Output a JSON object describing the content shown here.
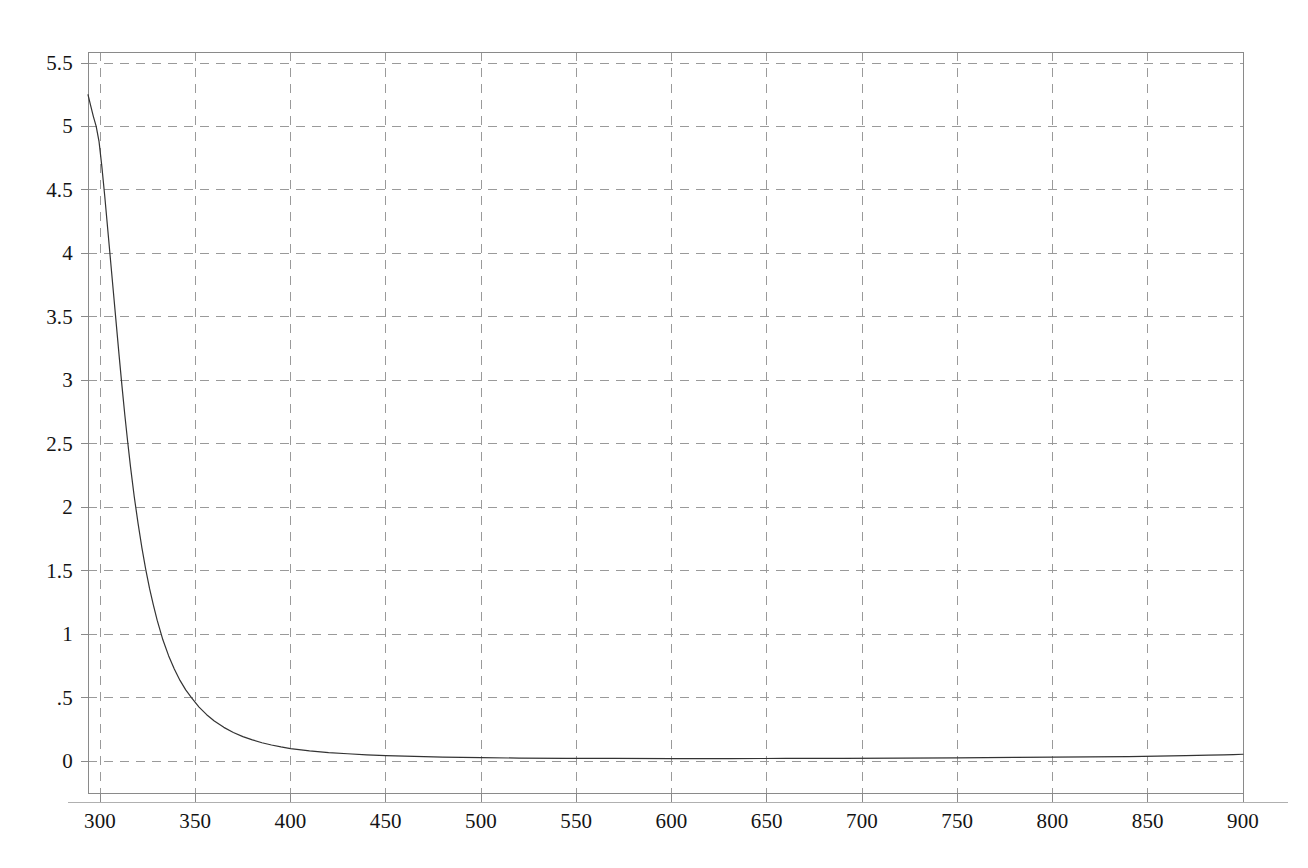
{
  "chart_data": {
    "type": "line",
    "title": "",
    "subtitle": "",
    "xlabel": "",
    "ylabel": "",
    "xlim": [
      293.7,
      900
    ],
    "ylim": [
      -0.35,
      5.65
    ],
    "grid": true,
    "grid_style": "dashed",
    "legend": false,
    "legend_position": "none",
    "xticks": [
      300,
      350,
      400,
      450,
      500,
      550,
      600,
      650,
      700,
      750,
      800,
      850,
      900
    ],
    "xtick_labels": [
      "300",
      "350",
      "400",
      "450",
      "500",
      "550",
      "600",
      "650",
      "700",
      "750",
      "800",
      "850",
      "900"
    ],
    "yticks": [
      0,
      0.5,
      1,
      1.5,
      2,
      2.5,
      3,
      3.5,
      4,
      4.5,
      5,
      5.5
    ],
    "ytick_labels": [
      "0",
      ".5",
      "1",
      "1.5",
      "2",
      "2.5",
      "3",
      "3.5",
      "4",
      "4.5",
      "5",
      "5.5"
    ],
    "series": [
      {
        "name": "curve",
        "color": "#333333",
        "line_width": 1.2,
        "x": [
          293.7,
          295,
          296.5,
          298,
          299.5,
          301,
          302.5,
          304,
          305.5,
          307,
          308.5,
          310,
          311.5,
          313,
          314.5,
          316,
          318,
          320,
          322,
          324,
          326,
          328,
          330,
          333,
          336,
          339,
          342,
          345,
          348,
          352,
          356,
          360,
          365,
          370,
          375,
          380,
          385,
          390,
          395,
          400,
          410,
          420,
          430,
          440,
          450,
          465,
          480,
          500,
          520,
          545,
          570,
          600,
          630,
          660,
          690,
          720,
          750,
          780,
          800,
          820,
          840,
          855,
          870,
          882,
          890,
          895,
          900
        ],
        "y": [
          5.25,
          5.17,
          5.08,
          5.0,
          4.88,
          4.68,
          4.45,
          4.2,
          3.95,
          3.7,
          3.45,
          3.2,
          2.96,
          2.73,
          2.52,
          2.32,
          2.08,
          1.87,
          1.68,
          1.51,
          1.36,
          1.23,
          1.11,
          0.955,
          0.83,
          0.725,
          0.635,
          0.56,
          0.5,
          0.425,
          0.365,
          0.315,
          0.265,
          0.225,
          0.192,
          0.166,
          0.144,
          0.126,
          0.111,
          0.098,
          0.08,
          0.066,
          0.057,
          0.049,
          0.043,
          0.036,
          0.031,
          0.026,
          0.023,
          0.021,
          0.02,
          0.019,
          0.019,
          0.02,
          0.021,
          0.023,
          0.025,
          0.028,
          0.03,
          0.032,
          0.035,
          0.038,
          0.042,
          0.046,
          0.049,
          0.051,
          0.053
        ]
      }
    ]
  },
  "axes": {
    "frame_color": "#8a8a8a",
    "grid_color": "#9a9a9a",
    "tick_color": "#8a8a8a",
    "label_color": "#141414"
  }
}
